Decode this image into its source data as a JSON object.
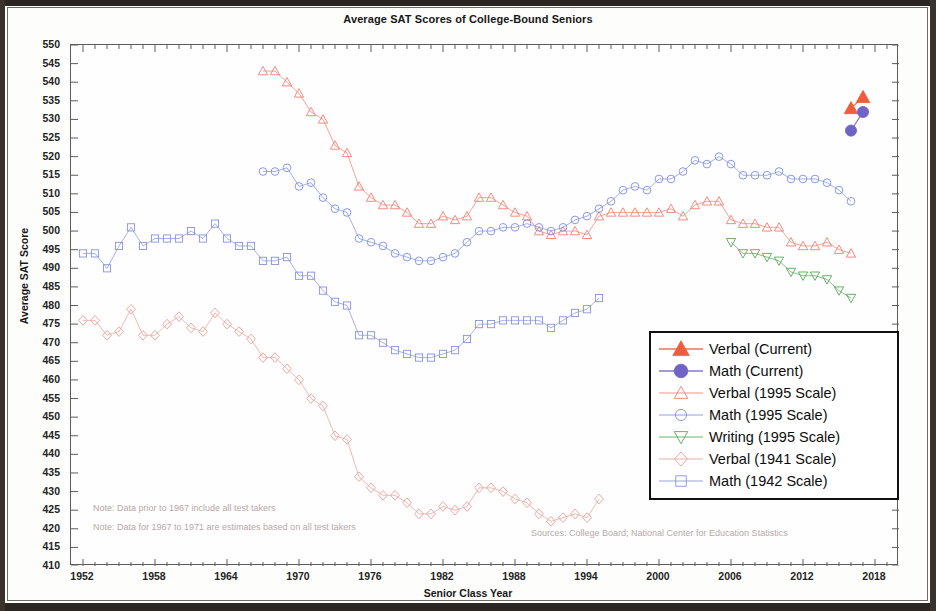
{
  "chart_data": {
    "type": "line",
    "title": "Average SAT Scores of College-Bound Seniors",
    "xlabel": "Senior Class Year",
    "ylabel": "Average SAT Score",
    "xlim": [
      1951,
      2020
    ],
    "ylim": [
      410,
      550
    ],
    "ytick_step": 5,
    "xtick_step": 6,
    "grid": false,
    "legend_position": "center-right",
    "yticks": [
      550,
      545,
      540,
      535,
      530,
      525,
      520,
      515,
      510,
      505,
      500,
      495,
      490,
      485,
      480,
      475,
      470,
      465,
      460,
      455,
      450,
      445,
      440,
      435,
      430,
      425,
      420,
      415,
      410
    ],
    "xticks": [
      1952,
      1958,
      1964,
      1970,
      1976,
      1982,
      1988,
      1994,
      2000,
      2006,
      2012,
      2018
    ],
    "notes": [
      "Note: Data prior to 1967 include all test takers",
      "Note: Data for 1967 to 1971 are estimates based on all test takers"
    ],
    "source": "Sources: College Board; National Center for Education Statistics",
    "series": [
      {
        "name": "Verbal (Current)",
        "color": "#ef5c3c",
        "marker": "triangle-up",
        "filled": true,
        "x": [
          2016,
          2017
        ],
        "values": [
          533,
          536
        ]
      },
      {
        "name": "Math (Current)",
        "color": "#6f63c6",
        "marker": "circle",
        "filled": true,
        "x": [
          2016,
          2017
        ],
        "values": [
          527,
          532
        ]
      },
      {
        "name": "Verbal (1995 Scale)",
        "color": "#f08071",
        "marker": "triangle-up",
        "filled": false,
        "x": [
          1967,
          1968,
          1969,
          1970,
          1971,
          1972,
          1973,
          1974,
          1975,
          1976,
          1977,
          1978,
          1979,
          1980,
          1981,
          1982,
          1983,
          1984,
          1985,
          1986,
          1987,
          1988,
          1989,
          1990,
          1991,
          1992,
          1993,
          1994,
          1995,
          1996,
          1997,
          1998,
          1999,
          2000,
          2001,
          2002,
          2003,
          2004,
          2005,
          2006,
          2007,
          2008,
          2009,
          2010,
          2011,
          2012,
          2013,
          2014,
          2015,
          2016
        ],
        "values": [
          543,
          543,
          540,
          537,
          532,
          530,
          523,
          521,
          512,
          509,
          507,
          507,
          505,
          502,
          502,
          504,
          503,
          504,
          509,
          509,
          507,
          505,
          504,
          500,
          499,
          500,
          500,
          499,
          504,
          505,
          505,
          505,
          505,
          505,
          506,
          504,
          507,
          508,
          508,
          503,
          502,
          502,
          501,
          501,
          497,
          496,
          496,
          497,
          495,
          494
        ]
      },
      {
        "name": "Math (1995 Scale)",
        "color": "#7f8fe0",
        "marker": "circle",
        "filled": false,
        "x": [
          1967,
          1968,
          1969,
          1970,
          1971,
          1972,
          1973,
          1974,
          1975,
          1976,
          1977,
          1978,
          1979,
          1980,
          1981,
          1982,
          1983,
          1984,
          1985,
          1986,
          1987,
          1988,
          1989,
          1990,
          1991,
          1992,
          1993,
          1994,
          1995,
          1996,
          1997,
          1998,
          1999,
          2000,
          2001,
          2002,
          2003,
          2004,
          2005,
          2006,
          2007,
          2008,
          2009,
          2010,
          2011,
          2012,
          2013,
          2014,
          2015,
          2016
        ],
        "values": [
          516,
          516,
          517,
          512,
          513,
          509,
          506,
          505,
          498,
          497,
          496,
          494,
          493,
          492,
          492,
          493,
          494,
          497,
          500,
          500,
          501,
          501,
          502,
          501,
          500,
          501,
          503,
          504,
          506,
          508,
          511,
          512,
          511,
          514,
          514,
          516,
          519,
          518,
          520,
          518,
          515,
          515,
          515,
          516,
          514,
          514,
          514,
          513,
          511,
          508
        ]
      },
      {
        "name": "Writing (1995 Scale)",
        "color": "#57a85a",
        "marker": "triangle-down",
        "filled": false,
        "x": [
          2006,
          2007,
          2008,
          2009,
          2010,
          2011,
          2012,
          2013,
          2014,
          2015,
          2016
        ],
        "values": [
          497,
          494,
          494,
          493,
          492,
          489,
          488,
          488,
          487,
          484,
          482
        ]
      },
      {
        "name": "Verbal (1941 Scale)",
        "color": "#e8a097",
        "marker": "diamond",
        "filled": false,
        "x": [
          1952,
          1953,
          1954,
          1955,
          1956,
          1957,
          1958,
          1959,
          1960,
          1961,
          1962,
          1963,
          1964,
          1965,
          1966,
          1967,
          1968,
          1969,
          1970,
          1971,
          1972,
          1973,
          1974,
          1975,
          1976,
          1977,
          1978,
          1979,
          1980,
          1981,
          1982,
          1983,
          1984,
          1985,
          1986,
          1987,
          1988,
          1989,
          1990,
          1991,
          1992,
          1993,
          1994,
          1995
        ],
        "values": [
          476,
          476,
          472,
          473,
          479,
          472,
          472,
          475,
          477,
          474,
          473,
          478,
          475,
          473,
          471,
          466,
          466,
          463,
          460,
          455,
          453,
          445,
          444,
          434,
          431,
          429,
          429,
          427,
          424,
          424,
          426,
          425,
          426,
          431,
          431,
          430,
          428,
          427,
          424,
          422,
          423,
          424,
          423,
          428
        ]
      },
      {
        "name": "Math (1942 Scale)",
        "color": "#8892dc",
        "marker": "square",
        "filled": false,
        "x": [
          1952,
          1953,
          1954,
          1955,
          1956,
          1957,
          1958,
          1959,
          1960,
          1961,
          1962,
          1963,
          1964,
          1965,
          1966,
          1967,
          1968,
          1969,
          1970,
          1971,
          1972,
          1973,
          1974,
          1975,
          1976,
          1977,
          1978,
          1979,
          1980,
          1981,
          1982,
          1983,
          1984,
          1985,
          1986,
          1987,
          1988,
          1989,
          1990,
          1991,
          1992,
          1993,
          1994,
          1995
        ],
        "values": [
          494,
          494,
          490,
          496,
          501,
          496,
          498,
          498,
          498,
          500,
          498,
          502,
          498,
          496,
          496,
          492,
          492,
          493,
          488,
          488,
          484,
          481,
          480,
          472,
          472,
          470,
          468,
          467,
          466,
          466,
          467,
          468,
          471,
          475,
          475,
          476,
          476,
          476,
          476,
          474,
          476,
          478,
          479,
          482
        ]
      }
    ]
  }
}
